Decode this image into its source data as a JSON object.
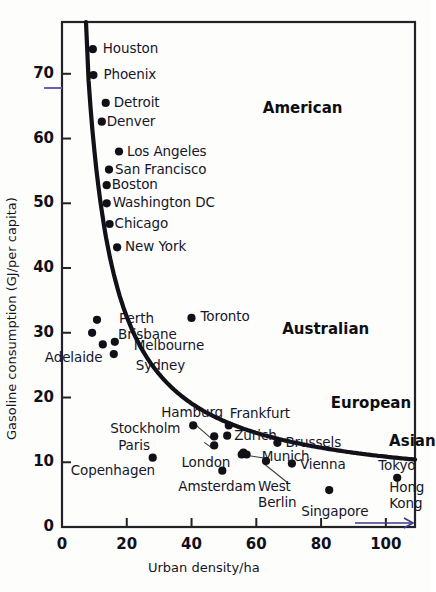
{
  "chart_data": {
    "type": "scatter",
    "title": "",
    "xlabel": "Urban density/ha",
    "ylabel": "Gasoline consumption (GJ/per capita)",
    "xlim": [
      0,
      109
    ],
    "ylim": [
      0,
      78
    ],
    "xticks": [
      0,
      20,
      40,
      60,
      80,
      100
    ],
    "yticks": [
      0,
      10,
      20,
      30,
      40,
      50,
      60,
      70
    ],
    "xtick_labels": [
      "0",
      "20",
      "40",
      "60",
      "80",
      "100"
    ],
    "ytick_labels": [
      "0",
      "10",
      "20",
      "30",
      "40",
      "50",
      "60",
      "70"
    ],
    "grid": false,
    "legend": false,
    "has_fit_curve": true,
    "fit_curve_note": "smooth decreasing hyperbola-like trend line through all points",
    "groups": [
      {
        "name": "American",
        "label_x": 62,
        "label_y": 64.5
      },
      {
        "name": "Australian",
        "label_x": 68,
        "label_y": 30.5
      },
      {
        "name": "European",
        "label_x": 83,
        "label_y": 19.0
      },
      {
        "name": "Asian",
        "label_x": 101,
        "label_y": 13.2
      }
    ],
    "points": [
      {
        "city": "Houston",
        "x": 9.5,
        "y": 73.8,
        "group": "American",
        "label_dx": 10,
        "label_dy": 0
      },
      {
        "city": "Phoenix",
        "x": 9.7,
        "y": 69.8,
        "group": "American",
        "label_dx": 10,
        "label_dy": 0
      },
      {
        "city": "Detroit",
        "x": 13.5,
        "y": 65.5,
        "group": "American",
        "label_dx": 8,
        "label_dy": 0
      },
      {
        "city": "Denver",
        "x": 12.3,
        "y": 62.6,
        "group": "American",
        "label_dx": 5,
        "label_dy": 0
      },
      {
        "city": "Los Angeles",
        "x": 17.6,
        "y": 58.0,
        "group": "American",
        "label_dx": 8,
        "label_dy": 0
      },
      {
        "city": "San Francisco",
        "x": 14.5,
        "y": 55.2,
        "group": "American",
        "label_dx": 6,
        "label_dy": 0
      },
      {
        "city": "Boston",
        "x": 13.8,
        "y": 52.8,
        "group": "American",
        "label_dx": 5,
        "label_dy": 0
      },
      {
        "city": "Washington DC",
        "x": 13.8,
        "y": 50.0,
        "group": "American",
        "label_dx": 6,
        "label_dy": 0
      },
      {
        "city": "Chicago",
        "x": 14.7,
        "y": 46.8,
        "group": "American",
        "label_dx": 5,
        "label_dy": 0
      },
      {
        "city": "New York",
        "x": 17.0,
        "y": 43.2,
        "group": "American",
        "label_dx": 8,
        "label_dy": 0
      },
      {
        "city": "Perth",
        "x": 10.8,
        "y": 32.0,
        "group": "Australian",
        "label_dx": 22,
        "label_dy": -1
      },
      {
        "city": "Brisbane",
        "x": 9.3,
        "y": 30.0,
        "group": "Australian",
        "label_dx": 26,
        "label_dy": 2
      },
      {
        "city": "Melbourne",
        "x": 16.3,
        "y": 28.6,
        "group": "Australian",
        "label_dx": 19,
        "label_dy": 4
      },
      {
        "city": "Adelaide",
        "x": 12.6,
        "y": 28.2,
        "group": "Australian",
        "label_dx": -58,
        "label_dy": 14
      },
      {
        "city": "Sydney",
        "x": 16.0,
        "y": 26.7,
        "group": "Australian",
        "label_dx": 22,
        "label_dy": 12
      },
      {
        "city": "Toronto",
        "x": 40.0,
        "y": 32.3,
        "group": "Australian",
        "label_dx": 9,
        "label_dy": -1
      },
      {
        "city": "Hamburg",
        "x": 40.5,
        "y": 15.7,
        "group": "European",
        "label_dx": -32,
        "label_dy": -12
      },
      {
        "city": "Frankfurt",
        "x": 51.5,
        "y": 15.7,
        "group": "European",
        "label_dx": 1,
        "label_dy": -11
      },
      {
        "city": "Zurich",
        "x": 51.0,
        "y": 14.1,
        "group": "European",
        "label_dx": 7,
        "label_dy": 0
      },
      {
        "city": "Stockholm",
        "x": 47.0,
        "y": 14.0,
        "group": "European",
        "label_dx": -104,
        "label_dy": -7
      },
      {
        "city": "Paris",
        "x": 47.0,
        "y": 12.6,
        "group": "European",
        "label_dx": -96,
        "label_dy": 1
      },
      {
        "city": "Brussels",
        "x": 66.5,
        "y": 13.0,
        "group": "European",
        "label_dx": 8,
        "label_dy": 0
      },
      {
        "city": "Munich",
        "x": 55.5,
        "y": 11.2,
        "group": "European",
        "label_dx": 20,
        "label_dy": 2
      },
      {
        "city": "Munich2",
        "x": 57.0,
        "y": 11.2,
        "group": "European",
        "label_dx": 0,
        "label_dy": 0
      },
      {
        "city": "Copenhagen",
        "x": 28.0,
        "y": 10.7,
        "group": "European",
        "label_dx": -82,
        "label_dy": 13
      },
      {
        "city": "West Berlin",
        "x": 63.0,
        "y": 10.2,
        "group": "European",
        "label_dx": -8,
        "label_dy": 26
      },
      {
        "city": "Vienna",
        "x": 71.0,
        "y": 9.8,
        "group": "European",
        "label_dx": 8,
        "label_dy": 1
      },
      {
        "city": "London",
        "x": 56.0,
        "y": 11.5,
        "group": "European",
        "label_dx": -62,
        "label_dy": 10
      },
      {
        "city": "Amsterdam",
        "x": 49.5,
        "y": 8.7,
        "group": "European",
        "label_dx": -44,
        "label_dy": 16
      },
      {
        "city": "Singapore",
        "x": 82.5,
        "y": 5.7,
        "group": "Asian",
        "label_dx": -28,
        "label_dy": 22
      },
      {
        "city": "Tokyo",
        "x": 103.5,
        "y": 7.6,
        "group": "Asian",
        "label_dx": -19,
        "label_dy": -12
      },
      {
        "city": "Hong Kong",
        "x": 103.5,
        "y": 7.6,
        "group": "Asian",
        "label_dx": -8,
        "label_dy": 10
      }
    ],
    "annotations": [
      {
        "kind": "arrow",
        "note": "blue arrow near bottom right pointing right",
        "x1": 94,
        "y1": 0.7,
        "x2": 108,
        "y2": 0.7
      }
    ]
  }
}
